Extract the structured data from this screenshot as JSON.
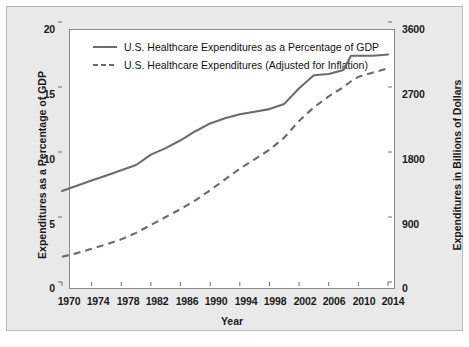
{
  "chart_data": {
    "type": "line",
    "title": "",
    "xlabel": "Year",
    "ylabel": "Expenditures as a Percentage of GDP",
    "ylabel_right": "Expenditures in Billions of Dollars",
    "xlim": [
      1970,
      2014
    ],
    "ylim": [
      0,
      20
    ],
    "ylim_right": [
      0,
      3600
    ],
    "grid": false,
    "legend_position": "upper-left-inside",
    "xticks": [
      "1970",
      "1974",
      "1978",
      "1982",
      "1986",
      "1990",
      "1994",
      "1998",
      "2002",
      "2006",
      "2010",
      "2014"
    ],
    "xtick_values": [
      1970,
      1974,
      1978,
      1982,
      1986,
      1990,
      1994,
      1998,
      2002,
      2006,
      2010,
      2014
    ],
    "yticks_left": [
      "0",
      "5",
      "10",
      "15",
      "20"
    ],
    "ytick_values_left": [
      0,
      5,
      10,
      15,
      20
    ],
    "yticks_right": [
      "0",
      "900",
      "1800",
      "2700",
      "3600"
    ],
    "ytick_values_right": [
      0,
      900,
      1800,
      2700,
      3600
    ],
    "x": [
      1970,
      1972,
      1974,
      1976,
      1978,
      1980,
      1982,
      1984,
      1986,
      1988,
      1990,
      1992,
      1994,
      1996,
      1998,
      2000,
      2002,
      2004,
      2006,
      2008,
      2009,
      2010,
      2012,
      2014
    ],
    "series": [
      {
        "name": "U.S. Healthcare Expenditures as a Percentage of GDP",
        "axis": "left",
        "style": "solid",
        "color": "#6b6b6b",
        "values": [
          7.0,
          7.4,
          7.8,
          8.2,
          8.6,
          9.0,
          9.8,
          10.3,
          10.9,
          11.6,
          12.2,
          12.6,
          12.9,
          13.1,
          13.3,
          13.7,
          14.9,
          15.9,
          16.0,
          16.3,
          17.4,
          17.4,
          17.4,
          17.5
        ],
        "start_value": 7.0,
        "end_value": 17.5
      },
      {
        "name": "U.S. Healthcare Expenditures (Adjusted for Inflation)",
        "axis": "right",
        "style": "dashed",
        "color": "#6b6b6b",
        "values_right_billions": [
          350,
          400,
          460,
          520,
          590,
          680,
          790,
          900,
          1010,
          1130,
          1270,
          1420,
          1570,
          1700,
          1830,
          2000,
          2230,
          2420,
          2570,
          2700,
          2780,
          2840,
          2900,
          2960
        ],
        "values_left_scale": [
          1.94,
          2.22,
          2.56,
          2.89,
          3.28,
          3.78,
          4.39,
          5.0,
          5.61,
          6.28,
          7.06,
          7.89,
          8.72,
          9.44,
          10.17,
          11.11,
          12.39,
          13.44,
          14.28,
          15.0,
          15.44,
          15.78,
          16.11,
          16.44
        ],
        "start_value": 350,
        "end_value": 2960
      }
    ]
  },
  "legend": {
    "entries": [
      {
        "label": "U.S. Healthcare Expenditures as a Percentage of GDP",
        "style": "solid"
      },
      {
        "label": "U.S. Healthcare Expenditures (Adjusted for Inflation)",
        "style": "dashed"
      }
    ]
  },
  "colors": {
    "line": "#6b6b6b",
    "panel_background": "#e9e9e9",
    "plot_background": "#ffffff",
    "axis": "#8a8a8a",
    "text": "#1a1a1a"
  }
}
